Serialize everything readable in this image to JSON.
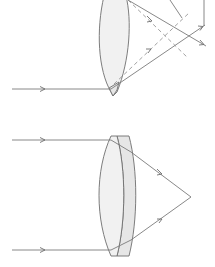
{
  "diagram": {
    "title": "",
    "figures": [
      {
        "name": "single-lens-chromatic-aberration",
        "description": "Single biconvex lens with incoming ray refracted, showing dashed construction rays"
      },
      {
        "name": "achromatic-doublet",
        "description": "Biconvex crown lens cemented to plano-concave flint lens; two parallel rays converge to a single focal point"
      }
    ],
    "colors": {
      "line": "#7a7a7a",
      "lens_fill": "#f1f1f1",
      "flint_fill": "#e6e6e6"
    }
  }
}
